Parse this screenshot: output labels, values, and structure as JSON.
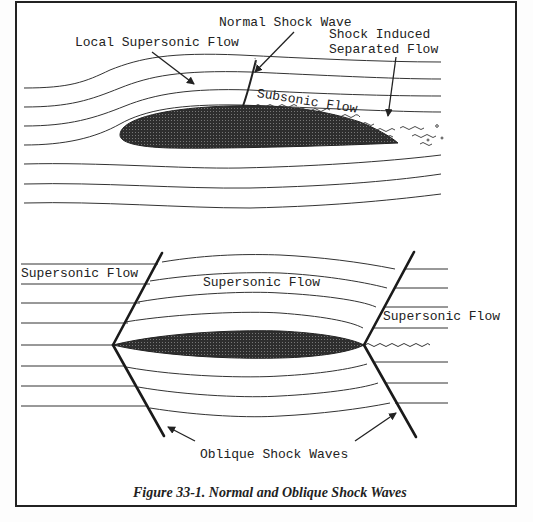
{
  "figure": {
    "caption": "Figure 33-1. Normal and Oblique Shock Waves",
    "colors": {
      "ink": "#222222",
      "airfoil_fill": "#3a3a3a",
      "background": "#ffffff"
    }
  },
  "top_diagram": {
    "title": "Normal shock on airfoil",
    "labels": {
      "normal_shock": "Normal Shock Wave",
      "local_supersonic": "Local Supersonic Flow",
      "shock_induced_line1": "Shock Induced",
      "shock_induced_line2": "Separated Flow",
      "subsonic": "Subsonic Flow"
    }
  },
  "bottom_diagram": {
    "title": "Oblique shocks on thin airfoil",
    "labels": {
      "supersonic_left": "Supersonic Flow",
      "supersonic_center": "Supersonic Flow",
      "supersonic_right": "Supersonic Flow",
      "oblique_shocks": "Oblique Shock Waves"
    }
  }
}
